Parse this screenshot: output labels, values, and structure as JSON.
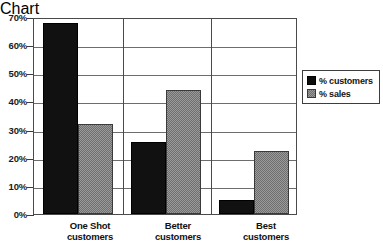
{
  "chart_data": {
    "type": "bar",
    "title": "",
    "subtitle": "",
    "xlabel": "",
    "ylabel": "",
    "categories": [
      "One Shot customers",
      "Better customers",
      "Best customers"
    ],
    "category_lines": [
      [
        "One Shot",
        "customers"
      ],
      [
        "Better",
        "customers"
      ],
      [
        "Best",
        "customers"
      ]
    ],
    "series": [
      {
        "name": "% customers",
        "values": [
          68,
          25.5,
          5
        ],
        "color": "#111111"
      },
      {
        "name": "% sales",
        "values": [
          32,
          44,
          22.5
        ],
        "color": "#9a9a9a"
      }
    ],
    "ylim": [
      0,
      70
    ],
    "ytick_values": [
      0,
      10,
      20,
      30,
      40,
      50,
      60,
      70
    ],
    "ytick_labels": [
      "0%",
      "10%",
      "20%",
      "30%",
      "40%",
      "50%",
      "60%",
      "70%"
    ],
    "grid": true,
    "grid_axis": "y",
    "legend_position": "right",
    "legend_entries": [
      "% customers",
      "% sales"
    ]
  },
  "legend": {
    "items": [
      {
        "label": "% customers",
        "swatch": "legend-swatch-customers"
      },
      {
        "label": "% sales",
        "swatch": "legend-swatch-sales"
      }
    ]
  }
}
